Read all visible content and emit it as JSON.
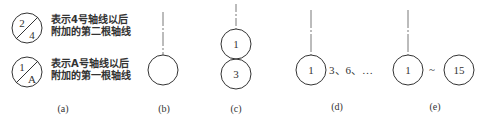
{
  "panel_a": {
    "label": "(a)",
    "symbols": [
      {
        "top": "2",
        "bottom": "4",
        "desc_line1": "表示4号轴线以后",
        "desc_line2": "附加的第二根轴线"
      },
      {
        "top": "1",
        "bottom": "A",
        "desc_line1": "表示A号轴线以后",
        "desc_line2": "附加的第一根轴线"
      }
    ]
  },
  "panel_b": {
    "label": "(b)"
  },
  "panel_c": {
    "label": "(c)",
    "circles": [
      "1",
      "3"
    ]
  },
  "panel_d": {
    "label": "(d)",
    "circle": "1",
    "note": "3、6、…"
  },
  "panel_e": {
    "label": "(e)",
    "circle_start": "1",
    "range_sign": "~",
    "circle_end": "15"
  },
  "colors": {
    "stroke": "#333333",
    "text": "#333333",
    "background": "#ffffff"
  }
}
